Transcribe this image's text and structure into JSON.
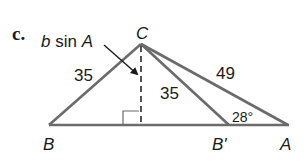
{
  "figure": {
    "part_label": "c.",
    "vertices": {
      "C": {
        "label": "C",
        "x": 141,
        "y": 44
      },
      "B": {
        "label": "B",
        "x": 49,
        "y": 125
      },
      "B_prime": {
        "label": "B'",
        "x": 229,
        "y": 125
      },
      "A": {
        "label": "A",
        "x": 288,
        "y": 125
      },
      "foot": {
        "x": 141,
        "y": 125
      }
    },
    "side_labels": {
      "CB": "35",
      "CB_prime": "35",
      "CA": "49"
    },
    "angle_label": "28°",
    "altitude_label_b": "b",
    "altitude_label_rest": " sin ",
    "altitude_label_A": "A",
    "colors": {
      "line": "#6b6b6b",
      "text": "#1a1a1a",
      "arrow": "#1a1a1a"
    }
  }
}
